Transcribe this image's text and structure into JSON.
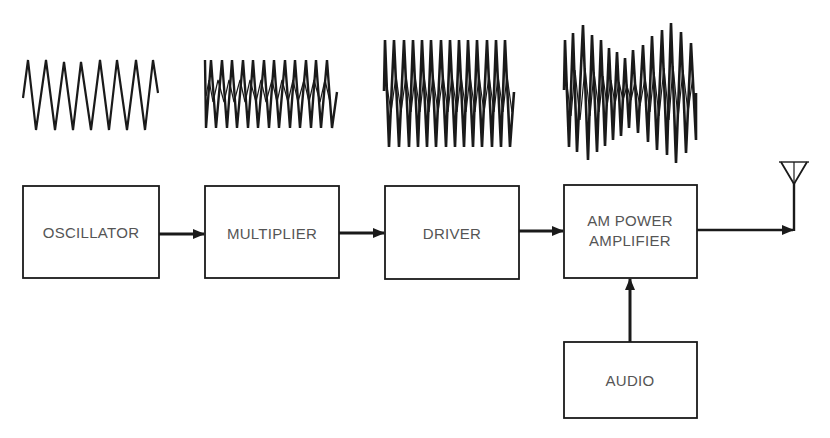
{
  "diagram": {
    "blocks": [
      {
        "id": "oscillator",
        "label": "OSCILLATOR",
        "lines": [
          "OSCILLATOR"
        ]
      },
      {
        "id": "multiplier",
        "label": "MULTIPLIER",
        "lines": [
          "MULTIPLIER"
        ]
      },
      {
        "id": "driver",
        "label": "DRIVER",
        "lines": [
          "DRIVER"
        ]
      },
      {
        "id": "am_power_amplifier",
        "label": "AM POWER AMPLIFIER",
        "lines": [
          "AM POWER",
          "AMPLIFIER"
        ]
      },
      {
        "id": "audio",
        "label": "AUDIO",
        "lines": [
          "AUDIO"
        ]
      }
    ],
    "connections": [
      {
        "from": "oscillator",
        "to": "multiplier"
      },
      {
        "from": "multiplier",
        "to": "driver"
      },
      {
        "from": "driver",
        "to": "am_power_amplifier"
      },
      {
        "from": "audio",
        "to": "am_power_amplifier"
      },
      {
        "from": "am_power_amplifier",
        "to": "antenna"
      }
    ],
    "waveforms": [
      {
        "stage": "oscillator",
        "type": "triangle",
        "cycles": 8,
        "amplitude": "low"
      },
      {
        "stage": "multiplier",
        "type": "triangle",
        "cycles": 15,
        "amplitude": "low"
      },
      {
        "stage": "driver",
        "type": "triangle",
        "cycles": 15,
        "amplitude": "high"
      },
      {
        "stage": "am_power_amplifier",
        "type": "amplitude-modulated",
        "cycles": 15,
        "amplitude": "modulated"
      }
    ],
    "antenna": {
      "icon": "antenna-icon"
    },
    "colors": {
      "stroke": "#1a1a1a",
      "text": "#555555",
      "background": "#ffffff"
    }
  }
}
